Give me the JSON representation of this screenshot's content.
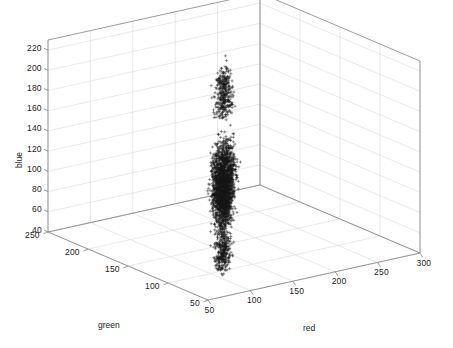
{
  "figure": {
    "background_color": "#ffffff",
    "axis_line_color": "#808080",
    "grid_color": "#d9d9d9",
    "marker_color": "#1a1a1a",
    "text_color": "#1a1a1a"
  },
  "chart_data": {
    "type": "scatter",
    "projection": "3d",
    "title": "",
    "xlabel": "red",
    "ylabel": "green",
    "zlabel": "blue",
    "xlim": [
      50,
      300
    ],
    "ylim": [
      50,
      250
    ],
    "zlim": [
      40,
      230
    ],
    "xticks": [
      50,
      100,
      150,
      200,
      250,
      300
    ],
    "yticks": [
      50,
      100,
      150,
      200,
      250
    ],
    "zticks": [
      40,
      60,
      80,
      100,
      120,
      140,
      160,
      180,
      200,
      220
    ],
    "xticklabels": [
      "50",
      "100",
      "150",
      "200",
      "250",
      "300"
    ],
    "yticklabels": [
      "50",
      "100",
      "150",
      "200",
      "250"
    ],
    "zticklabels": [
      "40",
      "60",
      "80",
      "100",
      "120",
      "140",
      "160",
      "180",
      "200",
      "220"
    ],
    "grid": true,
    "legend": null,
    "marker": "+",
    "marker_size": 3,
    "series": [
      {
        "name": "rgb pixel samples",
        "n_points": 2600,
        "description": "Dense vertical double-column cluster of RGB pixel triples; red concentrated 100-145, green concentrated 85-130, blue spread broadly 40-230 with outliers above.",
        "x_range": [
          95,
          150
        ],
        "y_range": [
          78,
          138
        ],
        "z_range": [
          38,
          232
        ],
        "x_mode": [
          112,
          133
        ],
        "y_mode": [
          96,
          118
        ],
        "z_mode": [
          130,
          175
        ]
      }
    ]
  },
  "axis_labels": {
    "red": "red",
    "green": "green",
    "blue": "blue"
  }
}
